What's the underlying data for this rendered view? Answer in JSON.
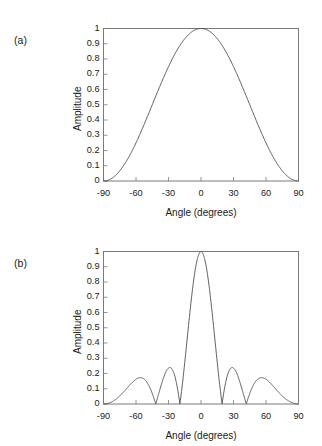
{
  "figure": {
    "background": "#ffffff",
    "line_color": "#4d4d4d",
    "frame_color": "#7a7a7a",
    "text_color": "#1a1a1a"
  },
  "panels": [
    {
      "id": "a",
      "label": "(a)",
      "xlabel": "Angle (degrees)",
      "ylabel": "Amplitude",
      "xticks": [
        "-90",
        "-60",
        "-30",
        "0",
        "30",
        "60",
        "90"
      ],
      "yticks": [
        "1",
        "0.9",
        "0.8",
        "0.7",
        "0.6",
        "0.5",
        "0.4",
        "0.3",
        "0.2",
        "0.1",
        "0"
      ]
    },
    {
      "id": "b",
      "label": "(b)",
      "xlabel": "Angle (degrees)",
      "ylabel": "Amplitude",
      "xticks": [
        "-90",
        "-60",
        "-30",
        "0",
        "30",
        "60",
        "90"
      ],
      "yticks": [
        "1",
        "0.9",
        "0.8",
        "0.7",
        "0.6",
        "0.5",
        "0.4",
        "0.3",
        "0.2",
        "0.1",
        "0"
      ]
    }
  ],
  "chart_data": [
    {
      "type": "line",
      "panel": "a",
      "title": "",
      "xlabel": "Angle (degrees)",
      "ylabel": "Amplitude",
      "xlim": [
        -90,
        90
      ],
      "ylim": [
        0,
        1
      ],
      "xticks": [
        -90,
        -60,
        -30,
        0,
        30,
        60,
        90
      ],
      "yticks": [
        0,
        0.1,
        0.2,
        0.3,
        0.4,
        0.5,
        0.6,
        0.7,
        0.8,
        0.9,
        1
      ],
      "grid": false,
      "legend": "none",
      "series": [
        {
          "name": "element pattern",
          "description": "single broad main lobe, peak 1.0 at 0 degrees, zeros at -90 and +90 degrees, half-amplitude (0.5) near -45 and +45 degrees",
          "x": [
            -90,
            -85,
            -80,
            -75,
            -70,
            -65,
            -60,
            -55,
            -50,
            -45,
            -40,
            -35,
            -30,
            -25,
            -20,
            -15,
            -10,
            -5,
            0,
            5,
            10,
            15,
            20,
            25,
            30,
            35,
            40,
            45,
            50,
            55,
            60,
            65,
            70,
            75,
            80,
            85,
            90
          ],
          "y": [
            0.0,
            0.008,
            0.03,
            0.067,
            0.117,
            0.179,
            0.25,
            0.329,
            0.413,
            0.5,
            0.587,
            0.671,
            0.75,
            0.821,
            0.883,
            0.933,
            0.97,
            0.992,
            1.0,
            0.992,
            0.97,
            0.933,
            0.883,
            0.821,
            0.75,
            0.671,
            0.587,
            0.5,
            0.413,
            0.329,
            0.25,
            0.179,
            0.117,
            0.067,
            0.03,
            0.008,
            0.0
          ]
        }
      ]
    },
    {
      "type": "line",
      "panel": "b",
      "title": "",
      "xlabel": "Angle (degrees)",
      "ylabel": "Amplitude",
      "xlim": [
        -90,
        90
      ],
      "ylim": [
        0,
        1
      ],
      "xticks": [
        -90,
        -60,
        -30,
        0,
        30,
        60,
        90
      ],
      "yticks": [
        0,
        0.1,
        0.2,
        0.3,
        0.4,
        0.5,
        0.6,
        0.7,
        0.8,
        0.9,
        1
      ],
      "grid": false,
      "legend": "none",
      "series": [
        {
          "name": "array pattern",
          "description": "narrow main lobe peaking at 1.0 at 0 degrees, nulls at -30, +30, -90 and +90 degrees, side lobes peaking near 0.27 at about -48 and +48 degrees",
          "x": [
            -90,
            -85,
            -80,
            -75,
            -70,
            -65,
            -60,
            -55,
            -50,
            -48,
            -45,
            -40,
            -35,
            -30,
            -25,
            -20,
            -15,
            -10,
            -5,
            0,
            5,
            10,
            15,
            20,
            25,
            30,
            35,
            40,
            45,
            48,
            50,
            55,
            60,
            65,
            70,
            75,
            80,
            85,
            90
          ],
          "y": [
            0.0,
            0.012,
            0.046,
            0.097,
            0.155,
            0.213,
            0.253,
            0.271,
            0.265,
            0.259,
            0.243,
            0.193,
            0.112,
            0.0,
            0.185,
            0.43,
            0.66,
            0.84,
            0.96,
            1.0,
            0.96,
            0.84,
            0.66,
            0.43,
            0.185,
            0.0,
            0.112,
            0.193,
            0.243,
            0.259,
            0.265,
            0.271,
            0.253,
            0.213,
            0.155,
            0.097,
            0.046,
            0.012,
            0.0
          ]
        }
      ]
    }
  ]
}
